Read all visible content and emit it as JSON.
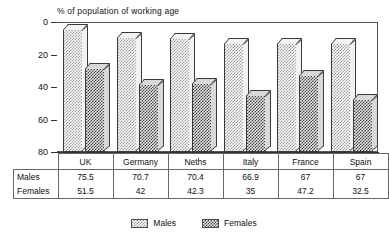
{
  "chart_data": {
    "type": "bar",
    "title": "% of population of working age",
    "xlabel": "",
    "ylabel": "",
    "ylim": [
      0,
      80
    ],
    "yticks": [
      0,
      20,
      40,
      60,
      80
    ],
    "grid": false,
    "legend_position": "bottom",
    "categories": [
      "UK",
      "Germany",
      "Neths",
      "Italy",
      "France",
      "Spain"
    ],
    "series": [
      {
        "name": "Males",
        "values": [
          75.5,
          70.7,
          70.4,
          66.9,
          67,
          67
        ]
      },
      {
        "name": "Females",
        "values": [
          51.5,
          42,
          42.3,
          35,
          47.2,
          32.5
        ]
      }
    ],
    "value_labels": {
      "males": [
        "75.5",
        "70.7",
        "70.4",
        "66.9",
        "67",
        "67"
      ],
      "females": [
        "51.5",
        "42",
        "42.3",
        "35",
        "47.2",
        "32.5"
      ]
    }
  },
  "axis": {
    "y_tick_labels": [
      "80",
      "60",
      "40",
      "20",
      "0"
    ]
  },
  "table": {
    "category_headers": [
      "UK",
      "Germany",
      "Neths",
      "Italy",
      "France",
      "Spain"
    ],
    "rows": [
      {
        "label": "Males",
        "values": [
          "75.5",
          "70.7",
          "70.4",
          "66.9",
          "67",
          "67"
        ]
      },
      {
        "label": "Females",
        "values": [
          "51.5",
          "42",
          "42.3",
          "35",
          "47.2",
          "32.5"
        ]
      }
    ]
  },
  "legend": {
    "items": [
      {
        "label": "Males",
        "color": "#c8c8c8"
      },
      {
        "label": "Females",
        "color": "#707070"
      }
    ]
  },
  "colors": {
    "males_fill": "#c8c8c8",
    "females_fill": "#707070",
    "outline": "#3a3a3a",
    "text": "#111111",
    "background": "#ffffff"
  }
}
